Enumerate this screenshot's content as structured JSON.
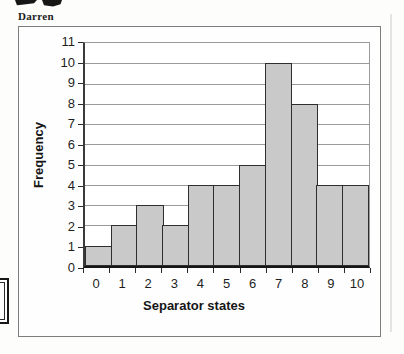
{
  "page": {
    "handwritten_note": "Darren"
  },
  "chart_data": {
    "type": "bar",
    "subtype": "histogram",
    "title": "",
    "categories": [
      "0",
      "1",
      "2",
      "3",
      "4",
      "5",
      "6",
      "7",
      "8",
      "9",
      "10"
    ],
    "values": [
      1,
      2,
      3,
      2,
      4,
      4,
      5,
      10,
      8,
      4,
      4
    ],
    "xlabel": "Separator states",
    "ylabel": "Frequency",
    "ylim": [
      0,
      11
    ],
    "yticks": [
      0,
      1,
      2,
      3,
      4,
      5,
      6,
      7,
      8,
      9,
      10,
      11
    ],
    "grid": "horizontal",
    "legend": "none",
    "bars_contiguous": true,
    "colors": {
      "bar_fill": "#c9c9c9",
      "bar_border": "#2e2e2e",
      "gridline": "#9a9a9a",
      "axis": "#161616",
      "chart_border": "#7d7d7d",
      "text": "#1e1e1e",
      "background": "#ffffff"
    }
  }
}
